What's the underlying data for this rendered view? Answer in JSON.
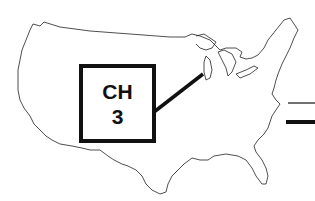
{
  "diagram": {
    "label_line1": "CH",
    "label_line2": "3",
    "map": "united-states-outline",
    "colors": {
      "ink": "#111111",
      "background": "#ffffff"
    }
  }
}
